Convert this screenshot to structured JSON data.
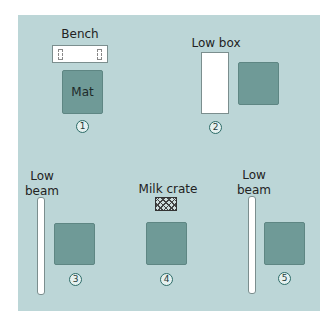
{
  "diagram": {
    "colors": {
      "background": "#bcd6d7",
      "mat": "#6f9a97",
      "equipment": "#ffffff",
      "number_ring": "#2c6b67"
    },
    "stations": [
      {
        "number": "1",
        "equipment_label": "Bench",
        "mat_label": "Mat"
      },
      {
        "number": "2",
        "equipment_label": "Low box"
      },
      {
        "number": "3",
        "equipment_label": "Low beam"
      },
      {
        "number": "4",
        "equipment_label": "Milk crate"
      },
      {
        "number": "5",
        "equipment_label": "Low beam"
      }
    ]
  }
}
